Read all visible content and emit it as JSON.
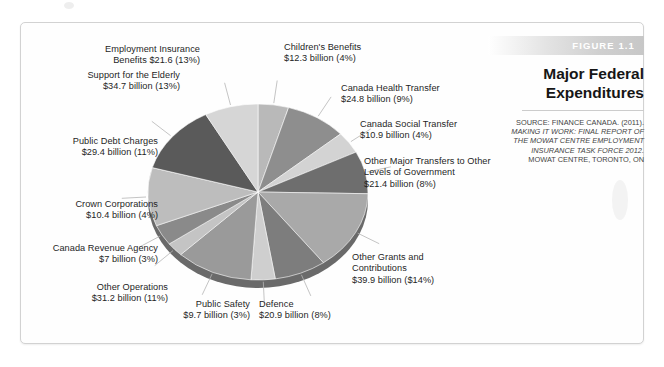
{
  "figure": {
    "banner_label": "FIGURE 1.1",
    "title_line_1": "Major Federal",
    "title_line_2": "Expenditures",
    "source_head": "SOURCE: FINANCE CANADA. (2011).",
    "source_italic_1": "MAKING IT WORK: FINAL REPORT OF",
    "source_italic_2": "THE MOWAT CENTRE EMPLOYMENT",
    "source_italic_3": "INSURANCE TASK FORCE 2012.",
    "source_tail": "MOWAT CENTRE, TORONTO, ON"
  },
  "callouts": {
    "employment_insurance": {
      "line1": "Employment Insurance",
      "line2": "Benefits $21.6 (13%)"
    },
    "childrens_benefits": {
      "line1": "Children's Benefits",
      "line2": "$12.3 billion (4%)"
    },
    "canada_health": {
      "line1": "Canada Health Transfer",
      "line2": "$24.8 billion (9%)"
    },
    "canada_social": {
      "line1": "Canada Social Transfer",
      "line2": "$10.9 billion (4%)"
    },
    "other_major_transfers": {
      "line1": "Other Major Transfers to Other",
      "line2": "Levels of Government",
      "line3": "$21.4 billion (8%)"
    },
    "other_grants": {
      "line1": "Other Grants and",
      "line2": "Contributions",
      "line3": "$39.9 billion ($14%)"
    },
    "defence": {
      "line1": "Defence",
      "line2": "$20.9 billion (8%)"
    },
    "public_safety": {
      "line1": "Public Safety",
      "line2": "$9.7 billion (3%)"
    },
    "other_operations": {
      "line1": "Other Operations",
      "line2": "$31.2 billion (11%)"
    },
    "canada_revenue": {
      "line1": "Canada Revenue Agency",
      "line2": "$7 billion (3%)"
    },
    "crown_corporations": {
      "line1": "Crown Corporations",
      "line2": "$10.4 billion (4%)"
    },
    "public_debt": {
      "line1": "Public Debt Charges",
      "line2": "$29.4 billion (11%)"
    },
    "support_elderly": {
      "line1": "Support for the Elderly",
      "line2": "$34.7 billion (13%)"
    }
  },
  "chart_data": {
    "type": "pie",
    "title": "Major Federal Expenditures",
    "xlabel": "",
    "ylabel": "",
    "units": "billions of Canadian dollars",
    "legend_position": "callout-labels",
    "grid": false,
    "start_angle_deg": 0,
    "direction": "clockwise",
    "categories": [
      "Children's Benefits",
      "Canada Health Transfer",
      "Canada Social Transfer",
      "Other Major Transfers to Other Levels of Government",
      "Other Grants and Contributions",
      "Defence",
      "Public Safety",
      "Other Operations",
      "Canada Revenue Agency",
      "Crown Corporations",
      "Public Debt Charges",
      "Support for the Elderly",
      "Employment Insurance Benefits"
    ],
    "values": [
      12.3,
      24.8,
      10.9,
      21.4,
      39.9,
      20.9,
      9.7,
      31.2,
      7.0,
      10.4,
      29.4,
      34.7,
      21.6
    ],
    "percents": [
      4,
      9,
      4,
      8,
      14,
      8,
      3,
      11,
      3,
      4,
      11,
      13,
      13
    ],
    "value_labels": [
      "$12.3 billion (4%)",
      "$24.8 billion (9%)",
      "$10.9 billion (4%)",
      "$21.4 billion (8%)",
      "$39.9 billion ($14%)",
      "$20.9 billion (8%)",
      "$9.7 billion (3%)",
      "$31.2 billion (11%)",
      "$7 billion (3%)",
      "$10.4 billion (4%)",
      "$29.4 billion (11%)",
      "$34.7 billion (13%)",
      "$21.6 (13%)"
    ],
    "slice_colors": [
      "#b9b9b9",
      "#8e8e8e",
      "#d3d3d3",
      "#6e6e6e",
      "#a9a9a9",
      "#7d7d7d",
      "#cfcfcf",
      "#9a9a9a",
      "#c4c4c4",
      "#8a8a8a",
      "#bdbdbd",
      "#5a5a5a",
      "#d6d6d6"
    ]
  }
}
